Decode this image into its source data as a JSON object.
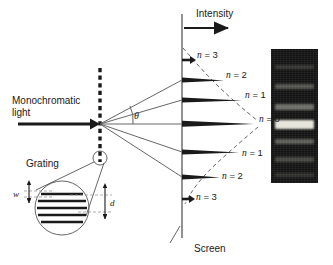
{
  "figure": {
    "background": "#ffffff",
    "ink": "#1a1a1a"
  },
  "labels": {
    "source_line1": "Monochromatic",
    "source_line2": "light",
    "grating": "Grating",
    "intensity": "Intensity",
    "screen": "Screen",
    "theta": "θ",
    "slit_width": "w",
    "slit_spacing": "d"
  },
  "orders": [
    {
      "id": "n3-up",
      "label": "n = 3",
      "n": 3,
      "side": "up",
      "y": 60,
      "peak_length": 13,
      "label_x": 197,
      "label_y": 55
    },
    {
      "id": "n2-up",
      "label": "n = 2",
      "n": 2,
      "side": "up",
      "y": 80,
      "peak_length": 42,
      "label_x": 226,
      "label_y": 75
    },
    {
      "id": "n1-up",
      "label": "n = 1",
      "n": 1,
      "side": "up",
      "y": 100,
      "peak_length": 60,
      "label_x": 245,
      "label_y": 95
    },
    {
      "id": "n0",
      "label": "n = 0",
      "n": 0,
      "side": "center",
      "y": 124,
      "peak_length": 72,
      "label_x": 259,
      "label_y": 119
    },
    {
      "id": "n1-down",
      "label": "n = 1",
      "n": -1,
      "side": "down",
      "y": 152,
      "peak_length": 57,
      "label_x": 242,
      "label_y": 153
    },
    {
      "id": "n2-down",
      "label": "n = 2",
      "n": -2,
      "side": "down",
      "y": 177,
      "peak_length": 38,
      "label_x": 222,
      "label_y": 176
    },
    {
      "id": "n3-down",
      "label": "n = 3",
      "n": -3,
      "side": "down",
      "y": 199,
      "peak_length": 13,
      "label_x": 196,
      "label_y": 196
    }
  ],
  "chart_data": {
    "type": "bar",
    "orientation": "horizontal",
    "title": "Intensity",
    "xlabel": "Intensity",
    "ylabel": "Diffraction order n",
    "categories": [
      "n = 3",
      "n = 2",
      "n = 1",
      "n = 0",
      "n = 1",
      "n = 2",
      "n = 3"
    ],
    "values": [
      13,
      42,
      60,
      72,
      57,
      38,
      13
    ],
    "grid": false,
    "legend": false
  },
  "geometry": {
    "screen_axis_x": 182,
    "screen_axis_top": 14,
    "screen_axis_bottom": 238,
    "grating_x": 100,
    "grating_top": 68,
    "grating_bottom": 162,
    "beam_axis_y": 124,
    "magnifier_circle": {
      "cx": 100,
      "cy": 158,
      "r": 7
    },
    "inset_circle": {
      "cx": 62,
      "cy": 208,
      "r": 27
    }
  },
  "photo": {
    "x": 271,
    "y": 49,
    "width": 47,
    "height": 134,
    "base_color": "#151515",
    "bands": [
      {
        "y": 16,
        "height": 4,
        "brightness": 0.2
      },
      {
        "y": 35,
        "height": 5,
        "brightness": 0.34
      },
      {
        "y": 55,
        "height": 6,
        "brightness": 0.45
      },
      {
        "y": 71,
        "height": 9,
        "brightness": 1.0
      },
      {
        "y": 90,
        "height": 5,
        "brightness": 0.38
      },
      {
        "y": 108,
        "height": 5,
        "brightness": 0.28
      },
      {
        "y": 124,
        "height": 4,
        "brightness": 0.18
      }
    ]
  },
  "inset_slits": [
    {
      "y": 194
    },
    {
      "y": 201
    },
    {
      "y": 208
    },
    {
      "y": 215
    },
    {
      "y": 222
    }
  ]
}
